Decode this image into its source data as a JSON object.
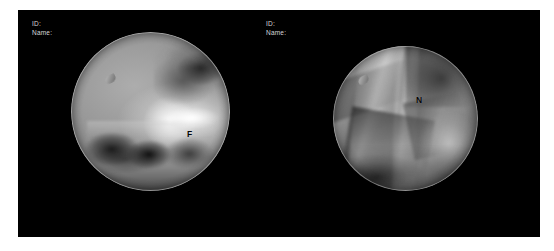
{
  "panel": {
    "background_color": "#000000",
    "page_background": "#ffffff"
  },
  "views": [
    {
      "id": "left",
      "modality": "arthroscopy",
      "overlay": {
        "id_label": "ID:",
        "name_label": "Name:",
        "id_value": "",
        "name_value": ""
      },
      "annotation": {
        "letter": "F",
        "meaning": "femur",
        "color": "#050505"
      }
    },
    {
      "id": "right",
      "modality": "arthroscopy",
      "overlay": {
        "id_label": "ID:",
        "name_label": "Name:",
        "id_value": "",
        "name_value": ""
      },
      "annotation": {
        "letter": "N",
        "meaning": "nerve",
        "color": "#050505"
      }
    }
  ]
}
